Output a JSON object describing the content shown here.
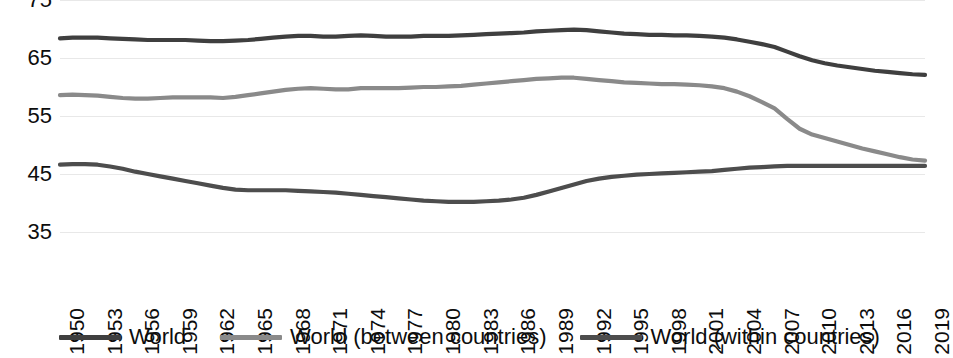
{
  "chart_data": {
    "type": "line",
    "title": "",
    "xlabel": "",
    "ylabel": "",
    "xlim": [
      1950,
      2019
    ],
    "ylim": [
      35,
      75
    ],
    "grid": true,
    "legend_position": "bottom",
    "y_ticks": [
      75,
      65,
      55,
      45,
      35
    ],
    "x_ticks": [
      1950,
      1953,
      1956,
      1959,
      1962,
      1965,
      1968,
      1971,
      1974,
      1977,
      1980,
      1983,
      1986,
      1989,
      1992,
      1995,
      1998,
      2001,
      2004,
      2007,
      2010,
      2013,
      2016,
      2019
    ],
    "x": [
      1950,
      1951,
      1952,
      1953,
      1954,
      1955,
      1956,
      1957,
      1958,
      1959,
      1960,
      1961,
      1962,
      1963,
      1964,
      1965,
      1966,
      1967,
      1968,
      1969,
      1970,
      1971,
      1972,
      1973,
      1974,
      1975,
      1976,
      1977,
      1978,
      1979,
      1980,
      1981,
      1982,
      1983,
      1984,
      1985,
      1986,
      1987,
      1988,
      1989,
      1990,
      1991,
      1992,
      1993,
      1994,
      1995,
      1996,
      1997,
      1998,
      1999,
      2000,
      2001,
      2002,
      2003,
      2004,
      2005,
      2006,
      2007,
      2008,
      2009,
      2010,
      2011,
      2012,
      2013,
      2014,
      2015,
      2016,
      2017,
      2018,
      2019
    ],
    "series": [
      {
        "name": "World",
        "color": "#3f3f3f",
        "values": [
          68.4,
          68.5,
          68.5,
          68.5,
          68.4,
          68.3,
          68.2,
          68.1,
          68.1,
          68.1,
          68.1,
          68.0,
          67.9,
          67.9,
          68.0,
          68.1,
          68.3,
          68.5,
          68.7,
          68.8,
          68.8,
          68.7,
          68.7,
          68.8,
          68.9,
          68.8,
          68.7,
          68.7,
          68.7,
          68.8,
          68.8,
          68.8,
          68.9,
          69.0,
          69.1,
          69.2,
          69.3,
          69.4,
          69.6,
          69.7,
          69.8,
          69.9,
          69.8,
          69.6,
          69.4,
          69.2,
          69.1,
          69.0,
          69.0,
          68.9,
          68.9,
          68.8,
          68.7,
          68.5,
          68.2,
          67.8,
          67.4,
          66.9,
          66.1,
          65.3,
          64.6,
          64.1,
          63.7,
          63.4,
          63.1,
          62.8,
          62.6,
          62.4,
          62.2,
          62.1
        ]
      },
      {
        "name": "World (between countries)",
        "color": "#8a8a8a",
        "values": [
          58.6,
          58.7,
          58.6,
          58.5,
          58.3,
          58.1,
          58.0,
          58.0,
          58.1,
          58.2,
          58.2,
          58.2,
          58.2,
          58.1,
          58.3,
          58.6,
          58.9,
          59.2,
          59.5,
          59.7,
          59.8,
          59.7,
          59.6,
          59.6,
          59.8,
          59.8,
          59.8,
          59.8,
          59.9,
          60.0,
          60.0,
          60.1,
          60.2,
          60.4,
          60.6,
          60.8,
          61.0,
          61.2,
          61.4,
          61.5,
          61.6,
          61.6,
          61.4,
          61.2,
          61.0,
          60.8,
          60.7,
          60.6,
          60.5,
          60.5,
          60.4,
          60.3,
          60.1,
          59.8,
          59.2,
          58.4,
          57.4,
          56.3,
          54.5,
          52.8,
          51.8,
          51.2,
          50.6,
          50.0,
          49.4,
          48.9,
          48.4,
          47.9,
          47.5,
          47.3
        ]
      },
      {
        "name": "World (within countries)",
        "color": "#4d4d4d",
        "values": [
          46.6,
          46.7,
          46.7,
          46.6,
          46.3,
          45.9,
          45.4,
          45.0,
          44.6,
          44.2,
          43.8,
          43.4,
          43.0,
          42.6,
          42.3,
          42.2,
          42.2,
          42.2,
          42.2,
          42.1,
          42.0,
          41.9,
          41.8,
          41.6,
          41.4,
          41.2,
          41.0,
          40.8,
          40.6,
          40.4,
          40.3,
          40.2,
          40.2,
          40.2,
          40.3,
          40.4,
          40.6,
          40.9,
          41.4,
          42.0,
          42.6,
          43.2,
          43.8,
          44.2,
          44.5,
          44.7,
          44.9,
          45.0,
          45.1,
          45.2,
          45.3,
          45.4,
          45.5,
          45.7,
          45.9,
          46.1,
          46.2,
          46.3,
          46.4,
          46.4,
          46.4,
          46.4,
          46.4,
          46.4,
          46.4,
          46.4,
          46.4,
          46.4,
          46.4,
          46.4
        ]
      }
    ]
  },
  "legend": {
    "items": [
      {
        "label": "World",
        "color": "#3f3f3f"
      },
      {
        "label": "World (between countries)",
        "color": "#8a8a8a"
      },
      {
        "label": "World (within countries)",
        "color": "#4d4d4d"
      }
    ]
  },
  "colors": {
    "gridline": "#e8e8e8",
    "text": "#0d0d0d",
    "background": "#ffffff"
  }
}
